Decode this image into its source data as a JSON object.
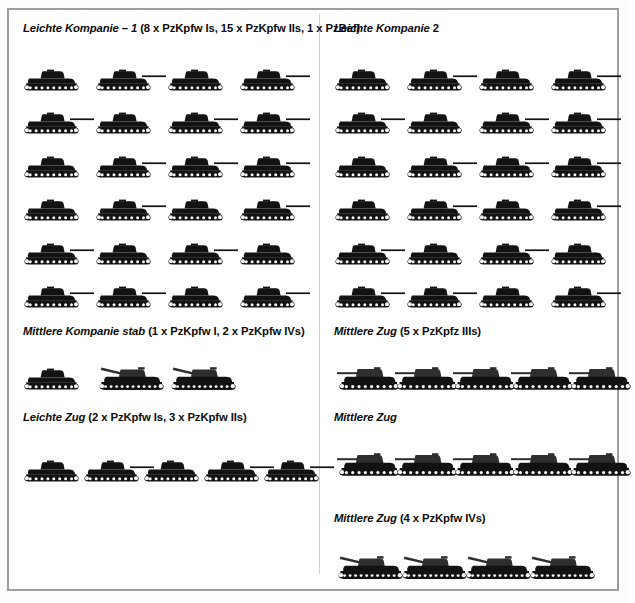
{
  "page": {
    "background": "#ffffff",
    "frame_color": "#9d9d9d",
    "divider_color": "#cfcfcf",
    "silhouette_color": "#121212"
  },
  "units": [
    {
      "id": "leichte-kompanie-1",
      "title_italic": "Leichte Kompanie – 1",
      "title_roman": "(8 x PzKpfw Is, 15 x PzKpfw IIs, 1 x PzBef)",
      "title_full": "Leichte Kompanie – 1 (8 x PzKpfw Is, 15 x PzKpfw IIs, 1 x PzBef)",
      "column": "left",
      "count": 24,
      "columns": 4,
      "rows": 6,
      "icon": "light-tank-icon",
      "composition": [
        {
          "type": "PzKpfw I",
          "count": 8
        },
        {
          "type": "PzKpfw II",
          "count": 15
        },
        {
          "type": "PzBef",
          "count": 1
        }
      ]
    },
    {
      "id": "leichte-kompanie-2",
      "title_italic": "Leichte Kompanie",
      "title_roman": "2",
      "title_full": "Leichte Kompanie 2",
      "column": "right",
      "count": 24,
      "columns": 4,
      "rows": 6,
      "icon": "light-tank-icon",
      "composition": []
    },
    {
      "id": "mittlere-kompanie-stab",
      "title_italic": "Mittlere Kompanie stab",
      "title_roman": "(1 x PzKpfw I, 2 x PzKpfw IVs)",
      "title_full": "Mittlere Kompanie stab (1 x PzKpfw I, 2 x PzKpfw IVs)",
      "column": "left",
      "count": 3,
      "columns": 3,
      "rows": 1,
      "icon": "mixed-tank-icon",
      "composition": [
        {
          "type": "PzKpfw I",
          "count": 1
        },
        {
          "type": "PzKpfw IV",
          "count": 2
        }
      ]
    },
    {
      "id": "mittlere-zug-iii-a",
      "title_italic": "Mittlere Zug",
      "title_roman": "(5 x PzKpfz IIIs)",
      "title_full": "Mittlere Zug (5 x PzKpfz IIIs)",
      "column": "right",
      "count": 5,
      "columns": 5,
      "rows": 1,
      "icon": "medium-tank-icon",
      "composition": [
        {
          "type": "PzKpfz III",
          "count": 5
        }
      ]
    },
    {
      "id": "leichte-zug",
      "title_italic": "Leichte Zug",
      "title_roman": "(2 x PzKpfw Is, 3 x PzKpfw IIs)",
      "title_full": "Leichte Zug (2 x PzKpfw Is, 3 x PzKpfw IIs)",
      "column": "left",
      "count": 5,
      "columns": 5,
      "rows": 1,
      "icon": "light-tank-icon",
      "composition": [
        {
          "type": "PzKpfw I",
          "count": 2
        },
        {
          "type": "PzKpfw II",
          "count": 3
        }
      ]
    },
    {
      "id": "mittlere-zug-iii-b",
      "title_italic": "Mittlere Zug",
      "title_roman": "",
      "title_full": "Mittlere Zug",
      "column": "right",
      "count": 5,
      "columns": 5,
      "rows": 1,
      "icon": "medium-tank-icon",
      "composition": []
    },
    {
      "id": "mittlere-zug-iv",
      "title_italic": "Mittlere Zug",
      "title_roman": "(4 x PzKpfw IVs)",
      "title_full": "Mittlere Zug (4 x PzKpfw IVs)",
      "column": "right",
      "count": 4,
      "columns": 4,
      "rows": 1,
      "icon": "heavy-tank-icon",
      "composition": [
        {
          "type": "PzKpfw IV",
          "count": 4
        }
      ]
    }
  ]
}
